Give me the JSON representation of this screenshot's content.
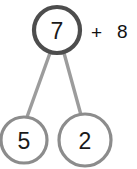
{
  "diagram": {
    "type": "number-bond",
    "whole": {
      "value": "7",
      "cx": 57,
      "cy": 30,
      "r": 23,
      "stroke": "#4d4d4d",
      "stroke_width": 4.2,
      "font_size": 23
    },
    "parts": [
      {
        "name": "left-part",
        "value": "5",
        "cx": 24,
        "cy": 140,
        "r": 23,
        "stroke": "#8c8c8c",
        "stroke_width": 3.2,
        "font_size": 23
      },
      {
        "name": "right-part",
        "value": "2",
        "cx": 85,
        "cy": 140,
        "r": 26,
        "stroke": "#8c8c8c",
        "stroke_width": 3.2,
        "font_size": 23
      }
    ],
    "connectors": [
      {
        "name": "left-connector",
        "x1": 50,
        "y1": 53,
        "x2": 27,
        "y2": 117,
        "stroke": "#9c9c9c",
        "stroke_width": 3.4
      },
      {
        "name": "right-connector",
        "x1": 64,
        "y1": 53,
        "x2": 81,
        "y2": 115,
        "stroke": "#9c9c9c",
        "stroke_width": 3.4
      }
    ]
  },
  "expression": {
    "operator": "+",
    "addend": "8"
  },
  "colors": {
    "background": "#ffffff",
    "whole_circle_stroke": "#4d4d4d",
    "part_circle_stroke": "#8c8c8c",
    "connector_stroke": "#9c9c9c",
    "text": "#1a1a1a"
  }
}
